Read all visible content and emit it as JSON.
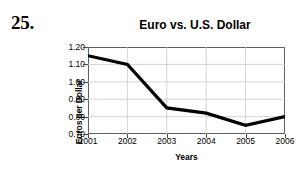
{
  "problem": {
    "number": "25."
  },
  "chart_data": {
    "type": "line",
    "title": "Euro vs. U.S. Dollar",
    "xlabel": "Years",
    "ylabel": "Euros per Dollar",
    "categories": [
      "2001",
      "2002",
      "2003",
      "2004",
      "2005",
      "2006"
    ],
    "values": [
      1.15,
      1.1,
      0.85,
      0.82,
      0.75,
      0.8
    ],
    "series": [
      {
        "name": "Euros per Dollar",
        "values": [
          1.15,
          1.1,
          0.85,
          0.82,
          0.75,
          0.8
        ]
      }
    ],
    "ylim": [
      0.7,
      1.2
    ],
    "ytick_labels": [
      "1.20",
      "1.10",
      "1.00",
      "0.90",
      "0.80",
      "0.70"
    ],
    "ytick_values": [
      1.2,
      1.1,
      1.0,
      0.9,
      0.8,
      0.7
    ],
    "xtick_labels": [
      "2001",
      "2002",
      "2003",
      "2004",
      "2005",
      "2006"
    ],
    "grid": true,
    "legend": "none",
    "line_color": "#000000",
    "grid_color": "#c9c9c9",
    "frame_color": "#5f5f5f",
    "background_color": "#ffffff"
  }
}
